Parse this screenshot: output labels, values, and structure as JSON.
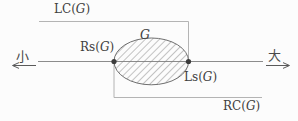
{
  "diagram": {
    "labels": {
      "lc": {
        "prefix": "LC(",
        "var": "G",
        "suffix": ")"
      },
      "rs": {
        "prefix": "Rs(",
        "var": "G",
        "suffix": ")"
      },
      "ls": {
        "prefix": "Ls(",
        "var": "G",
        "suffix": ")"
      },
      "rc": {
        "prefix": "RC(",
        "var": "G",
        "suffix": ")"
      },
      "set": {
        "var": "G"
      },
      "axis_left": "小",
      "axis_right": "大"
    },
    "colors": {
      "background": "#fcfcfc",
      "text": "#3f3f3f",
      "axis_line": "#8c8c8c",
      "bracket_line": "#ababab",
      "ellipse_stroke": "#707070",
      "hatch_line": "#7d7d7d",
      "endpoint_dot": "#3c3c3c",
      "arrow": "#5a5a5a"
    }
  }
}
